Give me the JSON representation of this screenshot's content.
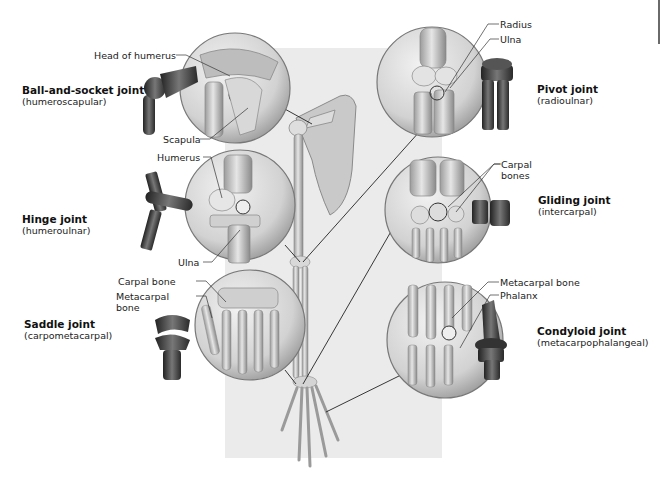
{
  "figure": {
    "colors": {
      "background": "#ffffff",
      "panel": "#ebebeb",
      "bone": "#d6d6d6",
      "bone_shadow": "#8a8a8a",
      "model_dark": "#3a3a3a",
      "leader_line": "#222222"
    }
  },
  "joints": [
    {
      "name": "Ball-and-socket joint",
      "example": "(humeroscapular)",
      "callouts": [
        "Head of humerus",
        "Scapula"
      ]
    },
    {
      "name": "Pivot joint",
      "example": "(radioulnar)",
      "callouts": [
        "Radius",
        "Ulna"
      ]
    },
    {
      "name": "Hinge joint",
      "example": "(humeroulnar)",
      "callouts": [
        "Humerus",
        "Ulna"
      ]
    },
    {
      "name": "Gliding joint",
      "example": "(intercarpal)",
      "callouts": [
        "Carpal bones"
      ]
    },
    {
      "name": "Saddle joint",
      "example": "(carpometacarpal)",
      "callouts": [
        "Carpal bone",
        "Metacarpal bone"
      ]
    },
    {
      "name": "Condyloid joint",
      "example": "(metacarpophalangeal)",
      "callouts": [
        "Metacarpal bone",
        "Phalanx"
      ]
    }
  ],
  "callout_lines": {
    "carpal_bones_l1": "Carpal",
    "carpal_bones_l2": "bones",
    "metacarpal_l1": "Metacarpal",
    "metacarpal_l2": "bone"
  }
}
